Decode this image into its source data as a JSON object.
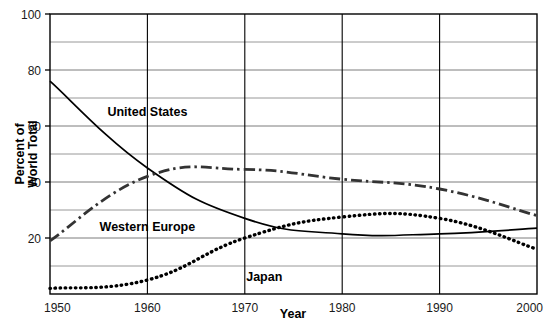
{
  "chart_data": {
    "type": "line",
    "title": "",
    "xlabel": "Year",
    "ylabel": "Percent of World Total",
    "x": [
      1950,
      1960,
      1970,
      1980,
      1990,
      2000
    ],
    "xlim": [
      1950,
      2000
    ],
    "ylim": [
      0,
      100
    ],
    "xticks": [
      "1950",
      "1960",
      "1970",
      "1980",
      "1990",
      "2000"
    ],
    "yticks": [
      "20",
      "40",
      "60",
      "80",
      "100"
    ],
    "ytick_values": [
      20,
      40,
      60,
      80,
      100
    ],
    "minor_gridlines_y": [
      10,
      30,
      50,
      70,
      90
    ],
    "grid": true,
    "legend": "inline-labels",
    "series": [
      {
        "name": "United States",
        "style": "solid",
        "color": "#000000",
        "label_x": 1960,
        "label_y": 65,
        "values": [
          76,
          45,
          27,
          21.5,
          21.5,
          23.5
        ]
      },
      {
        "name": "Western Europe",
        "style": "dash-dot",
        "color": "#333333",
        "label_x": 1960,
        "label_y": 24,
        "values": [
          19,
          42,
          44.5,
          41,
          37.5,
          28
        ]
      },
      {
        "name": "Japan",
        "style": "dotted",
        "color": "#000000",
        "label_x": 1972,
        "label_y": 6,
        "values": [
          2,
          5,
          20,
          27.5,
          27,
          16
        ]
      }
    ]
  },
  "axis": {
    "y_title_line1": "Percent of",
    "y_title_line2": "World Total",
    "x_title": "Year"
  }
}
